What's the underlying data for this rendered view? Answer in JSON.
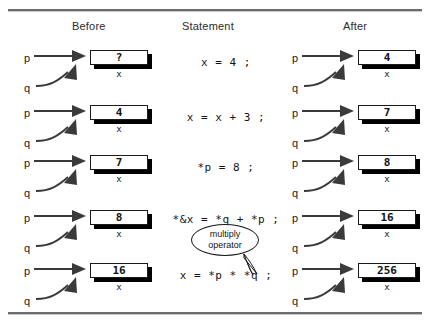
{
  "figure": {
    "headers": {
      "before": "Before",
      "statement": "Statement",
      "after": "After"
    },
    "pointer_labels": {
      "p": "p",
      "q": "q"
    },
    "variable_name": "x",
    "rows": [
      {
        "before_value": "?",
        "statement": "x = 4 ;",
        "after_value": "4"
      },
      {
        "before_value": "4",
        "statement": "x = x + 3 ;",
        "after_value": "7"
      },
      {
        "before_value": "7",
        "statement": "*p = 8 ;",
        "after_value": "8"
      },
      {
        "before_value": "8",
        "statement": "*&x = *q + *p ;",
        "after_value": "16"
      },
      {
        "before_value": "16",
        "statement": "x = *p * *q ;",
        "after_value": "256"
      }
    ],
    "callout": {
      "line1": "multiply",
      "line2": "operator"
    },
    "colors": {
      "rule": "#6b6b6b",
      "box_border": "#1a1a1a",
      "box_shadow": "#000000",
      "box_fill": "#ffffff",
      "text": "#1a1a1a",
      "arrow": "#3a3a3a"
    }
  }
}
